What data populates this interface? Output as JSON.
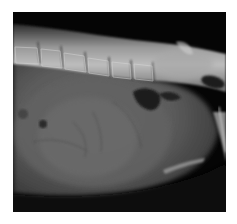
{
  "image": {
    "type": "radiograph",
    "view": "lateral abdomen",
    "description": "Lateral abdominal X-ray showing lumbar spine along the top, large soft-tissue opacity filling the abdomen, gas pockets and pelvis at right",
    "colors": {
      "background": "#ffffff",
      "film_dark": "#050505",
      "soft_tissue": "#5a5a5a",
      "bone": "#c8c8c8",
      "gas": "#1a1a1a"
    }
  }
}
